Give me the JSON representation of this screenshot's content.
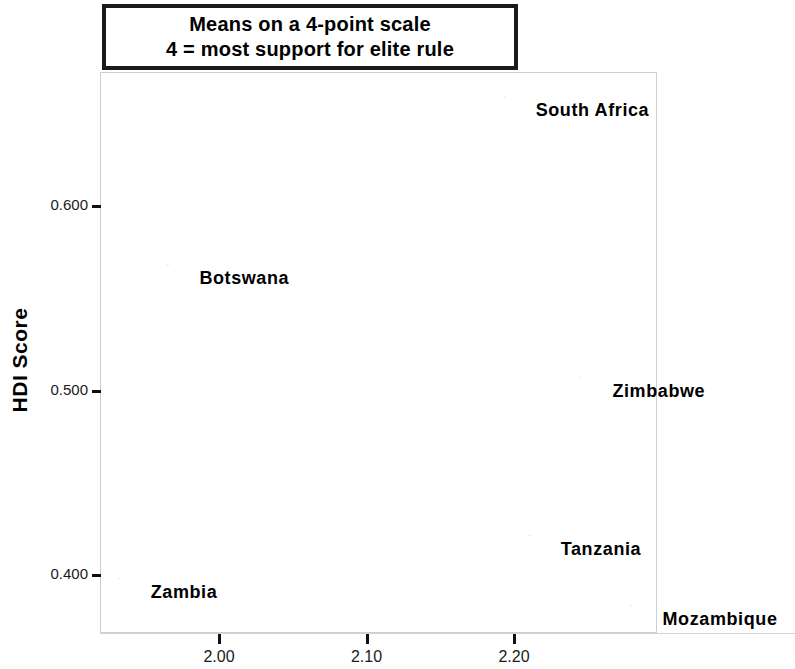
{
  "title": {
    "line1": "Means on a 4-point scale",
    "line2": "4 = most support for elite rule"
  },
  "chart_data": {
    "type": "scatter",
    "xlabel": "",
    "ylabel": "HDI Score",
    "xlim": [
      1.915,
      2.295
    ],
    "ylim": [
      0.368,
      0.673
    ],
    "xticks": [
      "2.00",
      "2.10",
      "2.20"
    ],
    "xtick_values": [
      2.0,
      2.1,
      2.2
    ],
    "yticks": [
      "0.600",
      "0.500",
      "0.400"
    ],
    "ytick_values": [
      0.6,
      0.5,
      0.4
    ],
    "grid": false,
    "legend": "none",
    "marker_style": "small-gray-glyph",
    "points": [
      {
        "label": "South Africa",
        "x": 2.193,
        "y": 0.659,
        "label_side": "right"
      },
      {
        "label": "Botswana",
        "x": 1.965,
        "y": 0.568,
        "label_side": "right"
      },
      {
        "label": "Zimbabwe",
        "x": 2.245,
        "y": 0.507,
        "label_side": "right"
      },
      {
        "label": "Tanzania",
        "x": 2.21,
        "y": 0.421,
        "label_side": "right"
      },
      {
        "label": "Zambia",
        "x": 1.932,
        "y": 0.398,
        "label_side": "right"
      },
      {
        "label": "Mozambique",
        "x": 2.279,
        "y": 0.383,
        "label_side": "right"
      }
    ]
  },
  "axis": {
    "y_title": "HDI Score"
  },
  "marker_glyph": "·"
}
